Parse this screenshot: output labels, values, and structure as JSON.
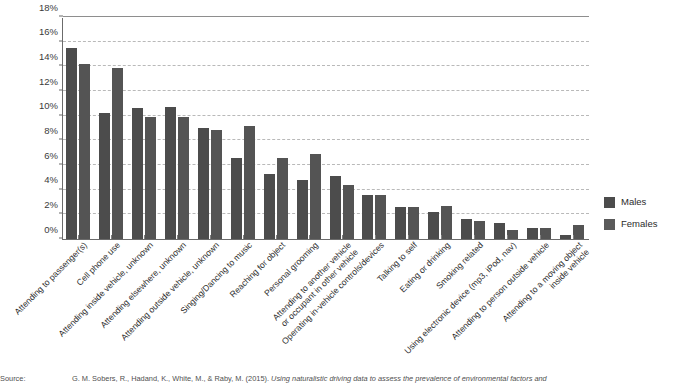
{
  "chart_data": {
    "type": "bar",
    "title": "",
    "subtitle": "",
    "xlabel": "",
    "ylabel": "",
    "ylim": [
      0,
      18
    ],
    "ytick_labels": [
      "0%",
      "2%",
      "4%",
      "6%",
      "8%",
      "10%",
      "12%",
      "14%",
      "16%",
      "18%"
    ],
    "ytick_values": [
      0,
      2,
      4,
      6,
      8,
      10,
      12,
      14,
      16,
      18
    ],
    "grid": true,
    "legend_position": "right",
    "categories": [
      "Attending to passenger(s)",
      "Cell phone use",
      "Attending inside vehicle, unknown",
      "Attending elsewhere, unknown",
      "Attending outside vehicle, unknown",
      "Singing/Dancing to music",
      "Reaching for object",
      "Personal grooming",
      "Attending to another vehicle or occupant in other vehicle",
      "Operating in-vehicle controls/devices",
      "Talking to self",
      "Eating or drinking",
      "Smoking related",
      "Using electronic device (mp3, iPod, nav)",
      "Attending to person outside vehicle",
      "Attending to a moving object inside vehicle"
    ],
    "category_lines": [
      [
        "Attending to passenger(s)"
      ],
      [
        "Cell phone use"
      ],
      [
        "Attending inside vehicle, unknown"
      ],
      [
        "Attending elsewhere, unknown"
      ],
      [
        "Attending outside vehicle, unknown"
      ],
      [
        "Singing/Dancing to music"
      ],
      [
        "Reaching for object"
      ],
      [
        "Personal grooming"
      ],
      [
        "Attending to another vehicle",
        "or occupant in other vehicle"
      ],
      [
        "Operating in-vehicle controls/devices"
      ],
      [
        "Talking to self"
      ],
      [
        "Eating or drinking"
      ],
      [
        "Smoking related"
      ],
      [
        "Using electronic device (mp3, iPod, nav)"
      ],
      [
        "Attending to person outside vehicle"
      ],
      [
        "Attending to a moving object",
        "inside vehicle"
      ]
    ],
    "series": [
      {
        "name": "Males",
        "color": "#4c4c4c",
        "values": [
          15.5,
          10.2,
          10.6,
          10.7,
          9.0,
          6.6,
          5.3,
          4.8,
          5.1,
          3.6,
          2.6,
          2.2,
          1.6,
          1.3,
          0.9,
          0.3
        ]
      },
      {
        "name": "Females",
        "color": "#545454",
        "values": [
          14.2,
          13.9,
          9.9,
          9.9,
          8.8,
          9.2,
          6.6,
          6.9,
          4.4,
          3.6,
          2.6,
          2.7,
          1.5,
          0.7,
          0.9,
          1.1
        ]
      }
    ]
  },
  "legend": {
    "items": [
      {
        "label": "Males",
        "color": "#4c4c4c"
      },
      {
        "label": "Females",
        "color": "#5a5a5a"
      }
    ]
  },
  "caption": {
    "source_label": "Source:",
    "text_plain": "G. M. Sobers, R., Hadand, K., White, M., & Raby, M. (2015).",
    "text_italic": "Using naturalistic driving data to assess the prevalence of environmental factors and"
  }
}
